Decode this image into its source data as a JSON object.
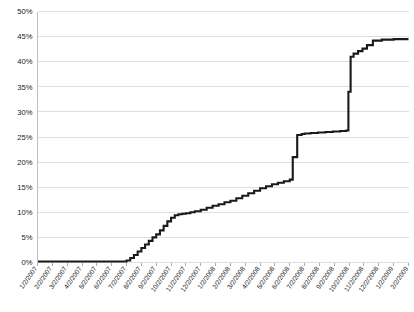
{
  "chart_data": {
    "type": "line",
    "title": "",
    "subtitle": "",
    "xlabel": "",
    "ylabel": "",
    "grid": true,
    "legend": false,
    "legend_position": "none",
    "line_color": "#1a1a1a",
    "grid_color": "#d6d6d6",
    "background_color": "#ffffff",
    "ylim": [
      0,
      50
    ],
    "y_tick_step": 5,
    "y_tick_labels": [
      "0%",
      "5%",
      "10%",
      "15%",
      "20%",
      "25%",
      "30%",
      "35%",
      "40%",
      "45%",
      "50%"
    ],
    "y_tick_values": [
      0,
      5,
      10,
      15,
      20,
      25,
      30,
      35,
      40,
      45,
      50
    ],
    "x_tick_labels": [
      "1/2/2007",
      "2/2/2007",
      "3/2/2007",
      "4/2/2007",
      "5/2/2007",
      "6/2/2007",
      "7/2/2007",
      "8/2/2007",
      "9/2/2007",
      "10/2/2007",
      "11/2/2007",
      "12/2/2007",
      "1/2/2008",
      "2/2/2008",
      "3/2/2008",
      "4/2/2008",
      "5/2/2008",
      "6/2/2008",
      "7/2/2008",
      "8/2/2008",
      "9/2/2008",
      "10/2/2008",
      "11/2/2008",
      "12/2/2008",
      "1/2/2009",
      "2/2/2009"
    ],
    "x_count": 26,
    "series_name": "cumulative-percent",
    "x": [
      0.0,
      0.6,
      1.2,
      1.8,
      2.4,
      3.0,
      3.6,
      4.2,
      4.8,
      5.4,
      6.0,
      6.25,
      6.5,
      6.75,
      7.0,
      7.25,
      7.5,
      7.75,
      8.0,
      8.25,
      8.5,
      8.75,
      9.0,
      9.25,
      9.5,
      9.75,
      10.0,
      10.3,
      10.6,
      11.0,
      11.4,
      11.8,
      12.2,
      12.6,
      13.0,
      13.4,
      13.8,
      14.2,
      14.6,
      15.0,
      15.4,
      15.8,
      16.2,
      16.6,
      17.0,
      17.2,
      17.5,
      17.8,
      18.0,
      18.4,
      18.9,
      19.4,
      19.9,
      20.4,
      20.8,
      20.95,
      21.1,
      21.3,
      21.6,
      21.9,
      22.2,
      22.6,
      23.2,
      24.0,
      25.0
    ],
    "values": [
      0.2,
      0.2,
      0.2,
      0.2,
      0.2,
      0.2,
      0.2,
      0.2,
      0.2,
      0.2,
      0.4,
      0.9,
      1.5,
      2.2,
      2.9,
      3.6,
      4.3,
      5.0,
      5.6,
      6.4,
      7.3,
      8.2,
      8.9,
      9.4,
      9.6,
      9.7,
      9.8,
      10.0,
      10.2,
      10.5,
      10.9,
      11.3,
      11.6,
      12.0,
      12.3,
      12.8,
      13.3,
      13.8,
      14.3,
      14.8,
      15.2,
      15.6,
      15.9,
      16.2,
      16.5,
      21.0,
      25.4,
      25.6,
      25.7,
      25.8,
      25.9,
      26.0,
      26.1,
      26.2,
      26.3,
      34.0,
      41.0,
      41.6,
      42.1,
      42.6,
      43.3,
      44.2,
      44.4,
      44.5,
      44.5
    ],
    "annotations": {
      "baseline_note": "flat near 0% from 1/2/2007 through 7/2/2007",
      "first_rise_note": "stepped climb from ~0% to ~10% between 7/2/2007 and 11/2/2007",
      "mid_plateau_note": "slow stepped climb from ~10% to ~16.5% through 6/2/2008",
      "first_jump_note": "sharp vertical jump from ~16.5% to ~25.5% around 6/2/2008",
      "second_jump_note": "sharp vertical jump from ~26% to ~41% around 10/2/2008",
      "final_plateau_note": "flat at ~44.5% from 12/2/2008 through 2/2/2009"
    }
  }
}
